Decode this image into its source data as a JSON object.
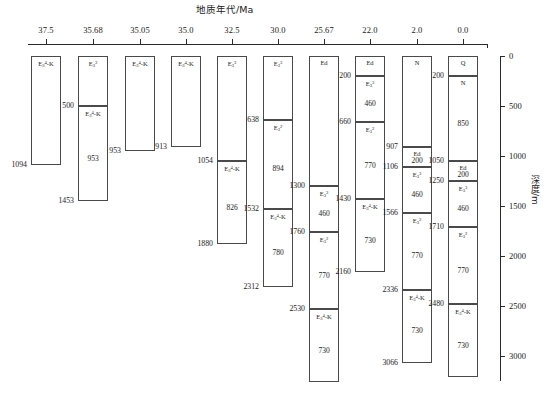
{
  "figure": {
    "age_axis_title": "地质年代/Ma",
    "depth_axis_title": "深度/m",
    "age_ticks": [
      "37.5",
      "35.68",
      "35.05",
      "35.0",
      "32.5",
      "30.0",
      "25.67",
      "22.0",
      "2.0",
      "0.0"
    ],
    "depth_ticks": [
      "0",
      "500",
      "1000",
      "1500",
      "2000",
      "2500",
      "3000"
    ],
    "depth_min": 0,
    "depth_max": 3300,
    "line_color": "#4a4a4a",
    "text_color": "#1a1a1a"
  },
  "columns": [
    {
      "age": "37.5",
      "units": [
        {
          "code_html": "E<sub>3</sub><sup>4</sup>-K",
          "top": 0,
          "bottom": 1094,
          "thickness": "",
          "top_label": "",
          "bottom_label": "1094",
          "label_side": "left"
        }
      ]
    },
    {
      "age": "35.68",
      "units": [
        {
          "code_html": "E<sub>3</sub><sup>3</sup>",
          "top": 0,
          "bottom": 500,
          "thickness": "",
          "top_label": "",
          "bottom_label": "500",
          "label_side": "left"
        },
        {
          "code_html": "E<sub>3</sub><sup>4</sup>-K",
          "top": 500,
          "bottom": 1453,
          "thickness": "953",
          "top_label": "",
          "bottom_label": "1453",
          "label_side": "left"
        }
      ]
    },
    {
      "age": "35.05",
      "units": [
        {
          "code_html": "E<sub>3</sub><sup>4</sup>-K",
          "top": 0,
          "bottom": 953,
          "thickness": "",
          "top_label": "",
          "bottom_label": "953",
          "label_side": "left"
        }
      ]
    },
    {
      "age": "35.0",
      "units": [
        {
          "code_html": "E<sub>3</sub><sup>4</sup>-K",
          "top": 0,
          "bottom": 913,
          "thickness": "",
          "top_label": "",
          "bottom_label": "913",
          "label_side": "left"
        }
      ]
    },
    {
      "age": "32.5",
      "units": [
        {
          "code_html": "E<sub>3</sub><sup>3</sup>",
          "top": 0,
          "bottom": 1054,
          "thickness": "",
          "top_label": "",
          "bottom_label": "1054",
          "label_side": "left"
        },
        {
          "code_html": "E<sub>3</sub><sup>4</sup>-K",
          "top": 1054,
          "bottom": 1880,
          "thickness": "826",
          "top_label": "",
          "bottom_label": "1880",
          "label_side": "left"
        }
      ]
    },
    {
      "age": "30.0",
      "units": [
        {
          "code_html": "E<sub>3</sub><sup>3</sup>",
          "top": 0,
          "bottom": 638,
          "thickness": "",
          "top_label": "",
          "bottom_label": "638",
          "label_side": "left"
        },
        {
          "code_html": "E<sub>3</sub><sup>2</sup>",
          "top": 638,
          "bottom": 1532,
          "thickness": "894",
          "top_label": "",
          "bottom_label": "1532",
          "label_side": "left"
        },
        {
          "code_html": "E<sub>3</sub><sup>4</sup>-K",
          "top": 1532,
          "bottom": 2312,
          "thickness": "780",
          "top_label": "",
          "bottom_label": "2312",
          "label_side": "left"
        }
      ]
    },
    {
      "age": "25.67",
      "units": [
        {
          "code_html": "Ed",
          "top": 0,
          "bottom": 1300,
          "thickness": "",
          "top_label": "",
          "bottom_label": "1300",
          "label_side": "left"
        },
        {
          "code_html": "E<sub>3</sub><sup>3</sup>",
          "top": 1300,
          "bottom": 1760,
          "thickness": "460",
          "top_label": "",
          "bottom_label": "1760",
          "label_side": "left"
        },
        {
          "code_html": "E<sub>3</sub><sup>2</sup>",
          "top": 1760,
          "bottom": 2530,
          "thickness": "770",
          "top_label": "",
          "bottom_label": "2530",
          "label_side": "left"
        },
        {
          "code_html": "E<sub>3</sub><sup>4</sup>-K",
          "top": 2530,
          "bottom": 3260,
          "thickness": "730",
          "top_label": "",
          "bottom_label": "",
          "label_side": "left"
        }
      ]
    },
    {
      "age": "22.0",
      "units": [
        {
          "code_html": "Ed",
          "top": 0,
          "bottom": 200,
          "thickness": "",
          "top_label": "",
          "bottom_label": "200",
          "label_side": "left"
        },
        {
          "code_html": "E<sub>3</sub><sup>3</sup>",
          "top": 200,
          "bottom": 660,
          "thickness": "460",
          "top_label": "",
          "bottom_label": "660",
          "label_side": "left"
        },
        {
          "code_html": "E<sub>3</sub><sup>2</sup>",
          "top": 660,
          "bottom": 1430,
          "thickness": "770",
          "top_label": "",
          "bottom_label": "1430",
          "label_side": "left"
        },
        {
          "code_html": "E<sub>3</sub><sup>4</sup>-K",
          "top": 1430,
          "bottom": 2160,
          "thickness": "730",
          "top_label": "",
          "bottom_label": "2160",
          "label_side": "left"
        }
      ]
    },
    {
      "age": "2.0",
      "units": [
        {
          "code_html": "N",
          "top": 0,
          "bottom": 907,
          "thickness": "",
          "top_label": "",
          "bottom_label": "907",
          "label_side": "left"
        },
        {
          "code_html": "Ed",
          "top": 907,
          "bottom": 1106,
          "thickness": "200",
          "top_label": "",
          "bottom_label": "1106",
          "label_side": "left"
        },
        {
          "code_html": "E<sub>3</sub><sup>3</sup>",
          "top": 1106,
          "bottom": 1566,
          "thickness": "460",
          "top_label": "",
          "bottom_label": "1566",
          "label_side": "left"
        },
        {
          "code_html": "E<sub>3</sub><sup>2</sup>",
          "top": 1566,
          "bottom": 2336,
          "thickness": "770",
          "top_label": "",
          "bottom_label": "2336",
          "label_side": "left"
        },
        {
          "code_html": "E<sub>3</sub><sup>4</sup>-K",
          "top": 2336,
          "bottom": 3066,
          "thickness": "730",
          "top_label": "",
          "bottom_label": "3066",
          "label_side": "left"
        }
      ]
    },
    {
      "age": "0.0",
      "units": [
        {
          "code_html": "Q",
          "top": 0,
          "bottom": 200,
          "thickness": "",
          "top_label": "",
          "bottom_label": "200",
          "label_side": "left"
        },
        {
          "code_html": "N",
          "top": 200,
          "bottom": 1050,
          "thickness": "850",
          "top_label": "",
          "bottom_label": "1050",
          "label_side": "left"
        },
        {
          "code_html": "Ed",
          "top": 1050,
          "bottom": 1250,
          "thickness": "200",
          "top_label": "",
          "bottom_label": "1250",
          "label_side": "left"
        },
        {
          "code_html": "E<sub>3</sub><sup>3</sup>",
          "top": 1250,
          "bottom": 1710,
          "thickness": "460",
          "top_label": "",
          "bottom_label": "1710",
          "label_side": "left"
        },
        {
          "code_html": "E<sub>3</sub><sup>2</sup>",
          "top": 1710,
          "bottom": 2480,
          "thickness": "770",
          "top_label": "",
          "bottom_label": "2480",
          "label_side": "left"
        },
        {
          "code_html": "E<sub>3</sub><sup>4</sup>-K",
          "top": 2480,
          "bottom": 3210,
          "thickness": "730",
          "top_label": "",
          "bottom_label": "",
          "label_side": "left"
        }
      ]
    }
  ],
  "chart_data": {
    "type": "table",
    "title": "地质年代/Ma",
    "xlabel": "地质年代/Ma",
    "ylabel": "深度/m",
    "x": [
      "37.5",
      "35.68",
      "35.05",
      "35.0",
      "32.5",
      "30.0",
      "25.67",
      "22.0",
      "2.0",
      "0.0"
    ],
    "ylim": [
      0,
      3300
    ],
    "ytick_labels": [
      "0",
      "500",
      "1000",
      "1500",
      "2000",
      "2500",
      "3000"
    ],
    "grid": false,
    "legend": "none",
    "series": [
      {
        "name": "37.5 Ma",
        "units": [
          {
            "code": "E3_4-K",
            "top": 0,
            "bottom": 1094,
            "thickness": 1094
          }
        ]
      },
      {
        "name": "35.68 Ma",
        "units": [
          {
            "code": "E3_3",
            "top": 0,
            "bottom": 500,
            "thickness": 500
          },
          {
            "code": "E3_4-K",
            "top": 500,
            "bottom": 1453,
            "thickness": 953
          }
        ]
      },
      {
        "name": "35.05 Ma",
        "units": [
          {
            "code": "E3_4-K",
            "top": 0,
            "bottom": 953,
            "thickness": 953
          }
        ]
      },
      {
        "name": "35.0 Ma",
        "units": [
          {
            "code": "E3_4-K",
            "top": 0,
            "bottom": 913,
            "thickness": 913
          }
        ]
      },
      {
        "name": "32.5 Ma",
        "units": [
          {
            "code": "E3_3",
            "top": 0,
            "bottom": 1054,
            "thickness": 1054
          },
          {
            "code": "E3_4-K",
            "top": 1054,
            "bottom": 1880,
            "thickness": 826
          }
        ]
      },
      {
        "name": "30.0 Ma",
        "units": [
          {
            "code": "E3_3",
            "top": 0,
            "bottom": 638,
            "thickness": 638
          },
          {
            "code": "E3_2",
            "top": 638,
            "bottom": 1532,
            "thickness": 894
          },
          {
            "code": "E3_4-K",
            "top": 1532,
            "bottom": 2312,
            "thickness": 780
          }
        ]
      },
      {
        "name": "25.67 Ma",
        "units": [
          {
            "code": "Ed",
            "top": 0,
            "bottom": 1300,
            "thickness": 1300
          },
          {
            "code": "E3_3",
            "top": 1300,
            "bottom": 1760,
            "thickness": 460
          },
          {
            "code": "E3_2",
            "top": 1760,
            "bottom": 2530,
            "thickness": 770
          },
          {
            "code": "E3_4-K",
            "top": 2530,
            "bottom": 3260,
            "thickness": 730
          }
        ]
      },
      {
        "name": "22.0 Ma",
        "units": [
          {
            "code": "Ed",
            "top": 0,
            "bottom": 200,
            "thickness": 200
          },
          {
            "code": "E3_3",
            "top": 200,
            "bottom": 660,
            "thickness": 460
          },
          {
            "code": "E3_2",
            "top": 660,
            "bottom": 1430,
            "thickness": 770
          },
          {
            "code": "E3_4-K",
            "top": 1430,
            "bottom": 2160,
            "thickness": 730
          }
        ]
      },
      {
        "name": "2.0 Ma",
        "units": [
          {
            "code": "N",
            "top": 0,
            "bottom": 907,
            "thickness": 907
          },
          {
            "code": "Ed",
            "top": 907,
            "bottom": 1106,
            "thickness": 200
          },
          {
            "code": "E3_3",
            "top": 1106,
            "bottom": 1566,
            "thickness": 460
          },
          {
            "code": "E3_2",
            "top": 1566,
            "bottom": 2336,
            "thickness": 770
          },
          {
            "code": "E3_4-K",
            "top": 2336,
            "bottom": 3066,
            "thickness": 730
          }
        ]
      },
      {
        "name": "0.0 Ma",
        "units": [
          {
            "code": "Q",
            "top": 0,
            "bottom": 200,
            "thickness": 200
          },
          {
            "code": "N",
            "top": 200,
            "bottom": 1050,
            "thickness": 850
          },
          {
            "code": "Ed",
            "top": 1050,
            "bottom": 1250,
            "thickness": 200
          },
          {
            "code": "E3_3",
            "top": 1250,
            "bottom": 1710,
            "thickness": 460
          },
          {
            "code": "E3_2",
            "top": 1710,
            "bottom": 2480,
            "thickness": 770
          },
          {
            "code": "E3_4-K",
            "top": 2480,
            "bottom": 3210,
            "thickness": 730
          }
        ]
      }
    ]
  }
}
